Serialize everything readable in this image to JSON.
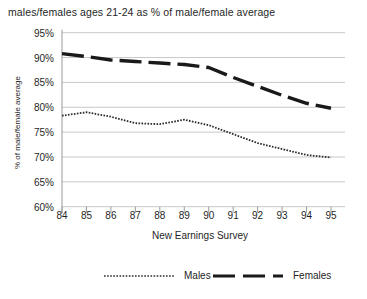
{
  "chart_data": {
    "type": "line",
    "title": "males/females ages 21-24 as % of male/female average",
    "xlabel": "New Earnings Survey",
    "ylabel": "% of male/female average",
    "categories": [
      "84",
      "85",
      "86",
      "87",
      "88",
      "89",
      "90",
      "91",
      "92",
      "93",
      "94",
      "95"
    ],
    "ylim": [
      60,
      95
    ],
    "yticks": [
      "60%",
      "65%",
      "70%",
      "75%",
      "80%",
      "85%",
      "90%",
      "95%"
    ],
    "ytick_values": [
      60,
      65,
      70,
      75,
      80,
      85,
      90,
      95
    ],
    "grid": true,
    "legend_position": "bottom",
    "series": [
      {
        "name": "Males",
        "style": "dotted-thin",
        "color": "#2a2a2a",
        "values": [
          78.3,
          79.0,
          78.1,
          76.8,
          76.6,
          77.5,
          76.4,
          74.6,
          72.8,
          71.6,
          70.4,
          69.9
        ]
      },
      {
        "name": "Females",
        "style": "dashed-thick",
        "color": "#1a1a1a",
        "values": [
          90.8,
          90.2,
          89.5,
          89.2,
          88.9,
          88.6,
          88.0,
          86.0,
          84.2,
          82.4,
          80.8,
          79.8
        ]
      }
    ]
  },
  "legend": {
    "males_label": "Males",
    "females_label": "Females"
  },
  "colors": {
    "gridline": "#c8c8c8",
    "axis": "#9a9a9a",
    "text": "#1f1f1f",
    "background": "#ffffff"
  }
}
